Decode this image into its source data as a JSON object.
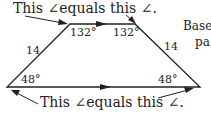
{
  "diagram": {
    "type": "trapezoid",
    "top_caption": "This ∠equals this ∠.",
    "bottom_caption": "This ∠equals this ∠.",
    "top_left_angle": "132°",
    "top_right_angle": "132°",
    "bottom_left_angle": "48°",
    "bottom_right_angle": "48°",
    "left_side": "14",
    "right_side": "14",
    "side_text_line1": "Base",
    "side_text_line2": "pa"
  }
}
